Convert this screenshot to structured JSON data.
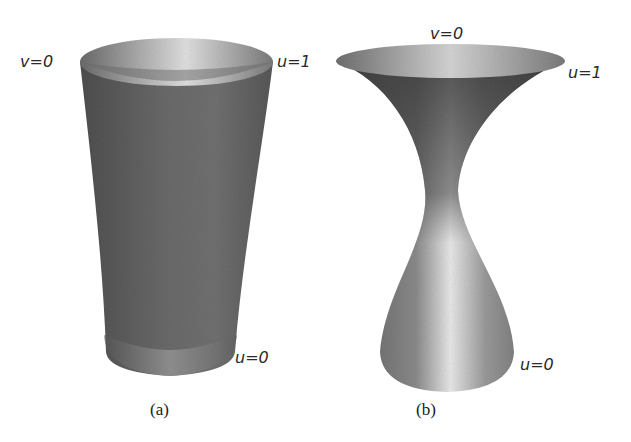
{
  "figure": {
    "panels": [
      {
        "id": "a",
        "caption": "(a)",
        "shape": "tapered cylinder surface (ruled surface)",
        "labels": {
          "top_left": "v=0",
          "top_right": "u=1",
          "bottom_right": "u=0"
        }
      },
      {
        "id": "b",
        "caption": "(b)",
        "shape": "hyperboloid-like hourglass surface",
        "labels": {
          "top": "v=0",
          "top_right": "u=1",
          "bottom_right": "u=0"
        }
      }
    ],
    "colors": {
      "surface_dark": "#5a5a5a",
      "surface_mid": "#8a8a8a",
      "surface_light": "#d8d8d8",
      "text": "#2a2a2a"
    }
  }
}
